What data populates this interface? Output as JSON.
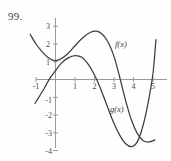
{
  "figure": {
    "problem_number": "99.",
    "background_color": "#fefefe",
    "curve_color": "#3d3d3d",
    "axis_color": "#9a9a9a"
  },
  "labels": {
    "f_label": "f(x)",
    "g_label": "g(x)"
  },
  "chart_data": {
    "type": "line",
    "title": "",
    "xlabel": "",
    "ylabel": "",
    "xlim": [
      -1.35,
      5.35
    ],
    "ylim": [
      -4.35,
      3.35
    ],
    "grid": false,
    "legend_position": "inline-annotation",
    "x_ticks": [
      -1,
      1,
      2,
      3,
      4,
      5
    ],
    "x_tick_labels": [
      "-1",
      "1",
      "2",
      "3",
      "4",
      "5"
    ],
    "y_ticks": [
      3,
      2,
      1,
      -1,
      -2,
      -3,
      -4
    ],
    "y_tick_labels": [
      "3",
      "2",
      "1",
      "-1",
      "-2",
      "-3",
      "-4"
    ],
    "annotations": [
      {
        "text": "f(x)",
        "x": 3.05,
        "y": 2.05
      },
      {
        "text": "g(x)",
        "x": 2.85,
        "y": -1.65
      }
    ],
    "series": [
      {
        "name": "f(x)",
        "points": [
          [
            -1.3,
            2.55
          ],
          [
            -1.0,
            2.0
          ],
          [
            -0.7,
            1.58
          ],
          [
            -0.4,
            1.25
          ],
          [
            -0.1,
            1.08
          ],
          [
            0.2,
            1.12
          ],
          [
            0.6,
            1.42
          ],
          [
            1.0,
            1.9
          ],
          [
            1.4,
            2.35
          ],
          [
            1.8,
            2.66
          ],
          [
            2.1,
            2.72
          ],
          [
            2.4,
            2.55
          ],
          [
            2.7,
            2.1
          ],
          [
            3.0,
            1.3
          ],
          [
            3.3,
            0.1
          ],
          [
            3.6,
            -1.2
          ],
          [
            3.9,
            -2.3
          ],
          [
            4.2,
            -3.05
          ],
          [
            4.5,
            -3.45
          ],
          [
            4.8,
            -3.52
          ],
          [
            5.1,
            -3.4
          ]
        ]
      },
      {
        "name": "g(x)",
        "points": [
          [
            -1.05,
            -1.35
          ],
          [
            -0.8,
            -0.9
          ],
          [
            -0.55,
            -0.45
          ],
          [
            -0.3,
            0.05
          ],
          [
            0.0,
            0.5
          ],
          [
            0.3,
            0.92
          ],
          [
            0.65,
            1.22
          ],
          [
            1.0,
            1.35
          ],
          [
            1.35,
            1.25
          ],
          [
            1.7,
            0.82
          ],
          [
            2.0,
            0.25
          ],
          [
            2.25,
            -0.35
          ],
          [
            2.6,
            -1.35
          ],
          [
            2.95,
            -2.35
          ],
          [
            3.3,
            -3.15
          ],
          [
            3.6,
            -3.62
          ],
          [
            3.9,
            -3.78
          ],
          [
            4.2,
            -3.5
          ],
          [
            4.5,
            -2.55
          ],
          [
            4.75,
            -1.3
          ],
          [
            5.0,
            0.35
          ],
          [
            5.15,
            2.25
          ]
        ]
      }
    ]
  }
}
